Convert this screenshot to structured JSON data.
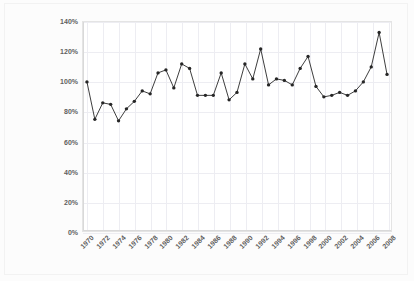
{
  "chart_data": {
    "type": "line",
    "title": "",
    "xlabel": "",
    "ylabel": "Global PM10 emissions as a percentage of the figure for 1970",
    "ylabel_lines": [
      "Global PM10 emissions as a",
      "percentage of the figure for 1970"
    ],
    "ylim": [
      0,
      140
    ],
    "ytick_labels": [
      "0%",
      "20%",
      "40%",
      "60%",
      "80%",
      "100%",
      "120%",
      "140%"
    ],
    "ytick_values": [
      0,
      20,
      40,
      60,
      80,
      100,
      120,
      140
    ],
    "xlim": [
      1969.5,
      2008.5
    ],
    "xtick_labels": [
      "1970",
      "1972",
      "1974",
      "1976",
      "1978",
      "1980",
      "1982",
      "1984",
      "1986",
      "1988",
      "1990",
      "1992",
      "1994",
      "1996",
      "1998",
      "2000",
      "2002",
      "2004",
      "2006",
      "2008"
    ],
    "xtick_values": [
      1970,
      1972,
      1974,
      1976,
      1978,
      1980,
      1982,
      1984,
      1986,
      1988,
      1990,
      1992,
      1994,
      1996,
      1998,
      2000,
      2002,
      2004,
      2006,
      2008
    ],
    "grid": true,
    "legend": false,
    "legend_position": "none",
    "marker": "circle",
    "series_color": "#262626",
    "grid_color": "#ededf2",
    "x": [
      1970,
      1971,
      1972,
      1973,
      1974,
      1975,
      1976,
      1977,
      1978,
      1979,
      1980,
      1981,
      1982,
      1983,
      1984,
      1985,
      1986,
      1987,
      1988,
      1989,
      1990,
      1991,
      1992,
      1993,
      1994,
      1995,
      1996,
      1997,
      1998,
      1999,
      2000,
      2001,
      2002,
      2003,
      2004,
      2005,
      2006,
      2007,
      2008
    ],
    "values": [
      100,
      75,
      86,
      85,
      74,
      82,
      87,
      94,
      92,
      106,
      108,
      96,
      112,
      109,
      91,
      91,
      91,
      106,
      88,
      93,
      112,
      102,
      122,
      98,
      102,
      101,
      98,
      109,
      117,
      97,
      90,
      91,
      93,
      91,
      94,
      100,
      110,
      133,
      105
    ],
    "units": "percent of 1970 value"
  }
}
